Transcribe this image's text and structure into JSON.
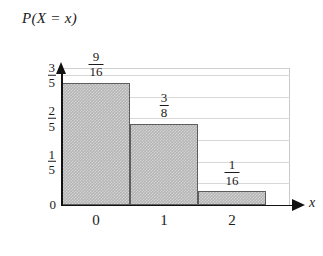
{
  "chart_data": {
    "type": "bar",
    "title": "P(X = x)",
    "xlabel": "x",
    "ylabel": "",
    "categories": [
      "0",
      "1",
      "2"
    ],
    "values": [
      0.5625,
      0.375,
      0.0625
    ],
    "value_labels": [
      {
        "num": "9",
        "den": "16"
      },
      {
        "num": "3",
        "den": "8"
      },
      {
        "num": "1",
        "den": "16"
      }
    ],
    "ylim": [
      0,
      0.6
    ],
    "y_ticks": [
      {
        "value": 0,
        "whole": "0"
      },
      {
        "value": 0.2,
        "num": "1",
        "den": "5"
      },
      {
        "value": 0.4,
        "num": "2",
        "den": "5"
      },
      {
        "value": 0.6,
        "num": "3",
        "den": "5"
      }
    ],
    "grid": true,
    "gridline_values": [
      0.6,
      0.5,
      0.4,
      0.3,
      0.2,
      0.1
    ],
    "legend": "none",
    "bar_fill_color": "#b5b5b5",
    "bar_edge_color": "#5d5d5d",
    "axis_color": "#121212",
    "grid_color": "#d8d8d8",
    "background_color": "#ffffff"
  }
}
